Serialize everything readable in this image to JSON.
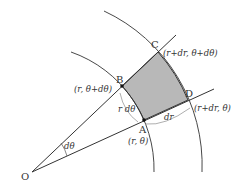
{
  "diagram": {
    "colors": {
      "line": "#333333",
      "shade": "#b8b8b8",
      "background": "#ffffff"
    },
    "points": {
      "O": {
        "label": "O",
        "x": 32,
        "y": 172
      },
      "A": {
        "label": "A",
        "coord": "(r, θ)",
        "x": 144,
        "y": 120
      },
      "B": {
        "label": "B",
        "coord": "(r, θ+dθ)",
        "x": 122,
        "y": 86
      },
      "C": {
        "label": "C",
        "coord": "(r+dr, θ+dθ)",
        "x": 158,
        "y": 52
      },
      "D": {
        "label": "D",
        "coord": "(r+dr, θ)",
        "x": 188,
        "y": 100
      }
    },
    "annotations": {
      "angle": "dθ",
      "arc_length": "r dθ",
      "radial_length": "dr"
    }
  }
}
